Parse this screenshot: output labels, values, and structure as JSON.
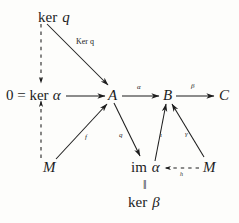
{
  "diagram": {
    "type": "commutative-diagram",
    "nodes": [
      {
        "id": "ker-q",
        "label_upright": "ker",
        "label_italic": "q",
        "x": 38,
        "y": 10,
        "full": "ker q"
      },
      {
        "id": "zero-ker-a",
        "label_upright": "0 = ker",
        "label_italic": "α",
        "x": 6,
        "y": 91,
        "full": "0 = ker α"
      },
      {
        "id": "A",
        "label_upright": "",
        "label_italic": "A",
        "x": 108,
        "y": 91,
        "full": "A"
      },
      {
        "id": "B",
        "label_upright": "",
        "label_italic": "B",
        "x": 163,
        "y": 91,
        "full": "B"
      },
      {
        "id": "C",
        "label_upright": "",
        "label_italic": "C",
        "x": 219,
        "y": 91,
        "full": "C"
      },
      {
        "id": "M-left",
        "label_upright": "",
        "label_italic": "M",
        "x": 45,
        "y": 163,
        "full": "M"
      },
      {
        "id": "im-alpha",
        "label_upright": "im",
        "label_italic": "α",
        "x": 132,
        "y": 163,
        "full": "im α"
      },
      {
        "id": "M-right",
        "label_upright": "",
        "label_italic": "M",
        "x": 203,
        "y": 163,
        "full": "M"
      },
      {
        "id": "ker-beta",
        "label_upright": "ker",
        "label_italic": "β",
        "x": 131,
        "y": 197,
        "full": "ker β"
      }
    ],
    "equality_bar": "‖",
    "edges": [
      {
        "id": "kerq-to-A",
        "label": "Ker q",
        "style": "solid",
        "from": "ker-q",
        "to": "A"
      },
      {
        "id": "kerq-to-kera",
        "label": "",
        "style": "dashed",
        "from": "ker-q",
        "to": "zero-ker-a"
      },
      {
        "id": "M-to-kera",
        "label": "",
        "style": "dashed",
        "from": "M-left",
        "to": "zero-ker-a"
      },
      {
        "id": "kera-to-A",
        "label": "",
        "style": "solid",
        "from": "zero-ker-a",
        "to": "A"
      },
      {
        "id": "A-to-B",
        "label": "α",
        "style": "solid",
        "from": "A",
        "to": "B"
      },
      {
        "id": "B-to-C",
        "label": "β",
        "style": "solid",
        "from": "B",
        "to": "C"
      },
      {
        "id": "M-to-A",
        "label": "f",
        "style": "solid",
        "from": "M-left",
        "to": "A"
      },
      {
        "id": "A-to-imalpha",
        "label": "q",
        "style": "solid",
        "from": "A",
        "to": "im-alpha"
      },
      {
        "id": "imalpha-to-B",
        "label": "ι",
        "style": "solid",
        "from": "im-alpha",
        "to": "B"
      },
      {
        "id": "Mright-to-B",
        "label": "γ",
        "style": "solid",
        "from": "M-right",
        "to": "B"
      },
      {
        "id": "Mright-to-imalpha",
        "label": "h",
        "style": "dashed",
        "from": "M-right",
        "to": "im-alpha"
      }
    ],
    "colors": {
      "ink": "#1c1c1c",
      "background": "#fdfdfb"
    }
  }
}
